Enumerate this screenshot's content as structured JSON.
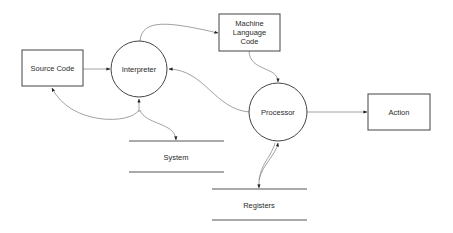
{
  "diagram": {
    "type": "data-flow-diagram",
    "nodes": {
      "source_code": {
        "kind": "external-entity",
        "label": "Source Code"
      },
      "interpreter": {
        "kind": "process",
        "label": "Interpreter"
      },
      "machine_code": {
        "kind": "external-entity",
        "label_lines": [
          "Machine",
          "Language",
          "Code"
        ]
      },
      "processor": {
        "kind": "process",
        "label": "Processor"
      },
      "action": {
        "kind": "external-entity",
        "label": "Action"
      },
      "system": {
        "kind": "data-store",
        "label": "System"
      },
      "registers": {
        "kind": "data-store",
        "label": "Registers"
      }
    },
    "edges": [
      {
        "from": "source_code",
        "to": "interpreter"
      },
      {
        "from": "interpreter",
        "to": "machine_code"
      },
      {
        "from": "machine_code",
        "to": "processor"
      },
      {
        "from": "processor",
        "to": "interpreter"
      },
      {
        "from": "processor",
        "to": "action"
      },
      {
        "from": "interpreter",
        "to": "source_code"
      },
      {
        "from": "interpreter",
        "to": "system",
        "bidirectional": true
      },
      {
        "from": "processor",
        "to": "registers",
        "bidirectional": true
      }
    ],
    "colors": {
      "shape_stroke": "#444444",
      "edge_stroke": "#8a8a8a",
      "text": "#2a2a2a",
      "background": "#ffffff"
    }
  }
}
